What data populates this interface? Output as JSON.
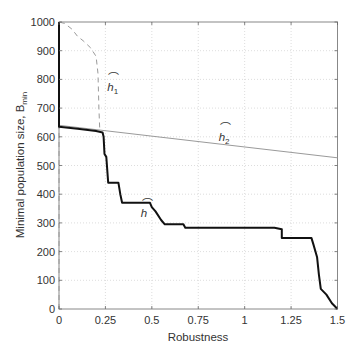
{
  "chart_data": {
    "type": "line",
    "title": "",
    "xlabel": "Robustness",
    "ylabel": "Minimal population size, B",
    "ylabel_subscript": "min",
    "xlim": [
      0,
      1.5
    ],
    "ylim": [
      0,
      1000
    ],
    "xticks": [
      0,
      0.25,
      0.5,
      0.75,
      1,
      1.25,
      1.5
    ],
    "xtick_labels": [
      "0",
      "0.25",
      "0.5",
      "0.75",
      "1",
      "1.25",
      "1.5"
    ],
    "yticks": [
      0,
      100,
      200,
      300,
      400,
      500,
      600,
      700,
      800,
      900,
      1000
    ],
    "ytick_labels": [
      "0",
      "100",
      "200",
      "300",
      "400",
      "500",
      "600",
      "700",
      "800",
      "900",
      "1000"
    ],
    "grid": true,
    "legend": "none (inline curve labels)",
    "series": [
      {
        "name": "h",
        "label": "h",
        "style": "solid-thick-black",
        "points": [
          [
            0,
            1000
          ],
          [
            0,
            635
          ],
          [
            0.1,
            628
          ],
          [
            0.2,
            620
          ],
          [
            0.235,
            615
          ],
          [
            0.24,
            600
          ],
          [
            0.245,
            540
          ],
          [
            0.255,
            530
          ],
          [
            0.265,
            440
          ],
          [
            0.32,
            440
          ],
          [
            0.33,
            400
          ],
          [
            0.34,
            370
          ],
          [
            0.49,
            370
          ],
          [
            0.5,
            355
          ],
          [
            0.52,
            340
          ],
          [
            0.55,
            310
          ],
          [
            0.57,
            295
          ],
          [
            0.67,
            295
          ],
          [
            0.68,
            283
          ],
          [
            1.16,
            283
          ],
          [
            1.2,
            278
          ],
          [
            1.2,
            247
          ],
          [
            1.36,
            247
          ],
          [
            1.37,
            225
          ],
          [
            1.39,
            180
          ],
          [
            1.4,
            120
          ],
          [
            1.41,
            70
          ],
          [
            1.44,
            50
          ],
          [
            1.47,
            20
          ],
          [
            1.5,
            0
          ]
        ]
      },
      {
        "name": "h1",
        "label": "h1",
        "style": "dashed-gray",
        "points": [
          [
            0,
            0
          ],
          [
            0,
            1000
          ],
          [
            0.03,
            995
          ],
          [
            0.07,
            975
          ],
          [
            0.1,
            950
          ],
          [
            0.13,
            935
          ],
          [
            0.17,
            910
          ],
          [
            0.2,
            880
          ],
          [
            0.21,
            820
          ],
          [
            0.215,
            700
          ],
          [
            0.22,
            620
          ]
        ]
      },
      {
        "name": "h2",
        "label": "h2",
        "style": "solid-thin-gray",
        "points": [
          [
            0,
            640
          ],
          [
            1.5,
            527
          ]
        ]
      }
    ],
    "annotations": [
      {
        "text": "h",
        "sub": "1",
        "x": 0.26,
        "y": 760
      },
      {
        "text": "h",
        "sub": "2",
        "x": 0.86,
        "y": 585
      },
      {
        "text": "h",
        "sub": "",
        "x": 0.44,
        "y": 320
      }
    ]
  }
}
